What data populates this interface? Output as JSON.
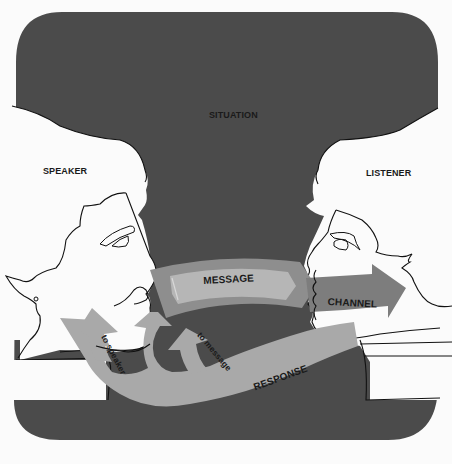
{
  "diagram": {
    "title": "",
    "labels": {
      "situation": "SITUATION",
      "speaker": "SPEAKER",
      "listener": "LISTENER",
      "message": "MESSAGE",
      "channel": "CHANNEL",
      "response": "RESPONSE",
      "to_speaker": "to speaker",
      "to_message": "to message"
    },
    "nodes": [
      {
        "id": "situation",
        "label": "SITUATION",
        "type": "background-region"
      },
      {
        "id": "speaker",
        "label": "SPEAKER",
        "type": "profile-head"
      },
      {
        "id": "listener",
        "label": "LISTENER",
        "type": "profile-head"
      },
      {
        "id": "message",
        "label": "MESSAGE",
        "type": "arrow-band"
      },
      {
        "id": "channel",
        "label": "CHANNEL",
        "type": "arrow"
      },
      {
        "id": "response",
        "label": "RESPONSE",
        "type": "curved-arrow"
      }
    ],
    "edges": [
      {
        "from": "speaker",
        "to": "listener",
        "via": "message",
        "label": "MESSAGE"
      },
      {
        "from": "message",
        "to": "listener",
        "label": "CHANNEL"
      },
      {
        "from": "listener",
        "to": "speaker",
        "label": "RESPONSE",
        "branch": "to speaker"
      },
      {
        "from": "listener",
        "to": "message",
        "label": "RESPONSE",
        "branch": "to message"
      }
    ],
    "colors": {
      "situation_bg": "#4a4a4a",
      "message_band": "#9a9a9a",
      "message_face": "#b5b5b5",
      "channel_arrow": "#7c7c7c",
      "response_arrow": "#a8a8a8",
      "outline": "#111111",
      "paper": "#fbfbfb"
    }
  }
}
